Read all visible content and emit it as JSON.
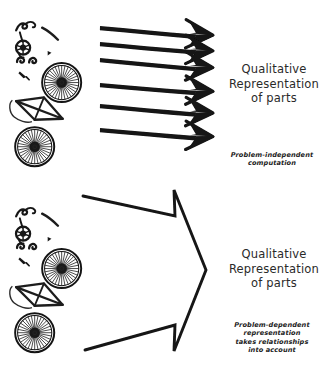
{
  "figure": {
    "kind": "hand-drawn-diagram",
    "background_color": "#ffffff",
    "ink_color": "#1a1a1a",
    "width": 328,
    "height": 373
  },
  "panels": [
    {
      "id": "top",
      "name": "problem-independent-panel",
      "source_label": "exploded bicycle parts",
      "arrow_style": "six-thin-parallel-arrows",
      "arrow_count": 6,
      "result_title": {
        "line1": "Qualitative",
        "line2": "Representation",
        "line3": "of parts"
      },
      "caption": {
        "line1": "Problem-independent",
        "line2": "computation"
      }
    },
    {
      "id": "bottom",
      "name": "problem-dependent-panel",
      "source_label": "exploded bicycle parts",
      "arrow_style": "single-large-outlined-arrow",
      "arrow_count": 1,
      "result_title": {
        "line1": "Qualitative",
        "line2": "Representation",
        "line3": "of parts"
      },
      "caption": {
        "line1": "Problem-dependent",
        "line2": "representation",
        "line3": "takes relationships",
        "line4": "into account"
      }
    }
  ],
  "bicycle_parts": [
    "handlebars",
    "saddle",
    "seat-post",
    "crank-gear",
    "pedal-hooks",
    "chain-link",
    "front-wheel",
    "rear-wheel",
    "frame-triangle"
  ]
}
